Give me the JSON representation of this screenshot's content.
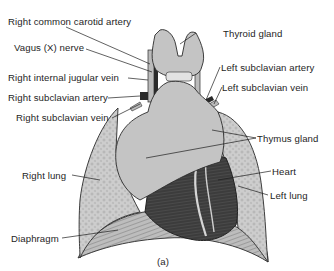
{
  "figure": {
    "panel_label": "(a)",
    "labels": {
      "right_common_carotid_artery": "Right common carotid artery",
      "vagus_nerve": "Vagus (X) nerve",
      "right_internal_jugular_vein": "Right internal jugular vein",
      "right_subclavian_artery": "Right subclavian artery",
      "right_subclavian_vein": "Right subclavian vein",
      "right_lung": "Right lung",
      "diaphragm": "Diaphragm",
      "thyroid_gland": "Thyroid gland",
      "left_subclavian_artery": "Left subclavian artery",
      "left_subclavian_vein": "Left subclavian vein",
      "thymus_gland": "Thymus gland",
      "heart": "Heart",
      "left_lung": "Left lung"
    },
    "colors": {
      "tissue_light": "#c4c4c4",
      "lung": "#cdcdcd",
      "heart_dark": "#3a3a3a",
      "vessel_dark": "#2a2a2a",
      "outline": "#2b2b2b",
      "text": "#1e1e1e"
    }
  }
}
